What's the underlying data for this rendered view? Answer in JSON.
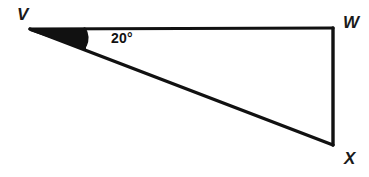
{
  "figure": {
    "type": "geometry-diagram",
    "shape": "triangle",
    "background_color": "#ffffff",
    "stroke_color": "#111111",
    "label_color": "#1a1a1a",
    "vertices": [
      {
        "name": "V",
        "label": "V",
        "x": 30,
        "y": 29
      },
      {
        "name": "W",
        "label": "W",
        "x": 333,
        "y": 28
      },
      {
        "name": "X",
        "label": "X",
        "x": 333,
        "y": 145
      }
    ],
    "sides": [
      {
        "name": "side-vw",
        "from": "V",
        "to": "W"
      },
      {
        "name": "side-wx",
        "from": "W",
        "to": "X"
      },
      {
        "name": "side-vx",
        "from": "V",
        "to": "X"
      }
    ],
    "angles": [
      {
        "name": "angle-at-v",
        "at_vertex": "V",
        "between": [
          "VW",
          "VX"
        ],
        "value": 20,
        "unit": "degrees",
        "label": "20°",
        "marker": "arc"
      }
    ]
  }
}
